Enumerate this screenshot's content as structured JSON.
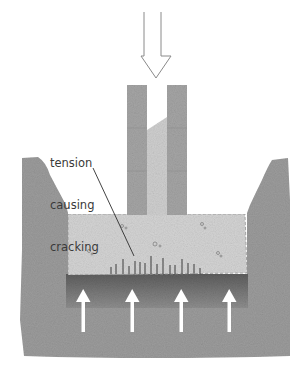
{
  "diagram": {
    "type": "strip-foundation-cross-section",
    "annotation": {
      "lines": [
        "tension",
        "causing",
        "cracking"
      ],
      "text": "tension causing cracking"
    },
    "elements": {
      "load_arrow": {
        "direction": "down",
        "style": "outline"
      },
      "wall": {
        "leaves": 2,
        "cavity_fill": true
      },
      "footing": {
        "material": "concrete",
        "crack_marks": 17
      },
      "ground": {
        "trench": true
      },
      "soil_pressure_arrows": {
        "count": 4,
        "direction": "up",
        "color": "#ffffff"
      }
    },
    "colors": {
      "ground": "#9a9a9a",
      "ground_dark_band": "#6e6e6e",
      "wall_leaf": "#a3a3a3",
      "wall_infill": "#cfcfcf",
      "footing": "#d2d2d2",
      "arrow_outline": "#8a8a8a",
      "crack": "#3c3c3c",
      "label_text": "#3a3a3a"
    }
  }
}
